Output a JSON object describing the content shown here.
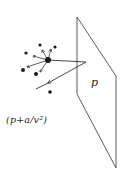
{
  "diagram": {
    "plane_label": "p",
    "equation_label": "(p+a/v²)",
    "colors": {
      "ink": "#1a1a1a",
      "background": "#ffffff"
    },
    "plane": {
      "vertices": [
        [
          77,
          17
        ],
        [
          116,
          76
        ],
        [
          116,
          168
        ],
        [
          77,
          94
        ]
      ]
    },
    "central_molecule": {
      "x": 48,
      "y": 60,
      "r": 3
    },
    "neighbour_molecules": [
      {
        "x": 40,
        "y": 45,
        "r": 1.6
      },
      {
        "x": 55,
        "y": 47,
        "r": 1.6
      },
      {
        "x": 26,
        "y": 53,
        "r": 1.6
      },
      {
        "x": 23,
        "y": 70,
        "r": 2
      },
      {
        "x": 36,
        "y": 74,
        "r": 2
      },
      {
        "x": 50,
        "y": 92,
        "r": 1.8
      }
    ],
    "attraction_arrows": [
      {
        "from": [
          48,
          60
        ],
        "to": [
          42,
          50
        ]
      },
      {
        "from": [
          48,
          60
        ],
        "to": [
          51,
          49
        ]
      },
      {
        "from": [
          48,
          60
        ],
        "to": [
          33,
          56
        ]
      },
      {
        "from": [
          48,
          60
        ],
        "to": [
          27,
          67
        ]
      },
      {
        "from": [
          48,
          60
        ],
        "to": [
          40,
          72
        ]
      }
    ],
    "trajectory": {
      "incoming": {
        "from": [
          48,
          60
        ],
        "to": [
          86,
          62
        ]
      },
      "rebound": {
        "from": [
          86,
          62
        ],
        "to": [
          36,
          89
        ],
        "arrowhead_at": [
          48,
          83
        ]
      }
    }
  }
}
